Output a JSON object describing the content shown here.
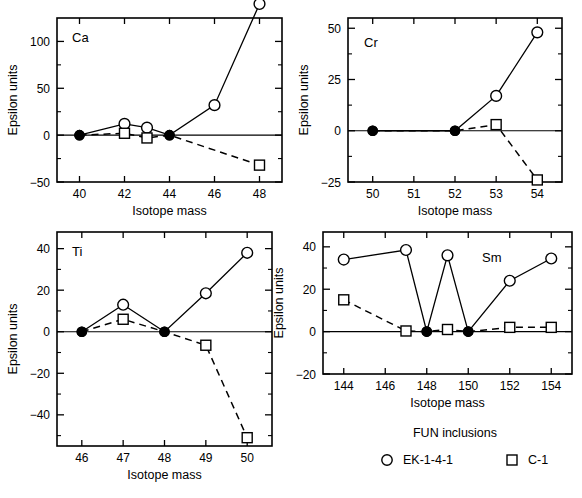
{
  "figure": {
    "axis_x_title": "Isotope mass",
    "axis_y_title": "Epsilon units"
  },
  "legend": {
    "title": "FUN inclusions",
    "entries": [
      {
        "marker": "open-circle-icon",
        "label": "EK-1-4-1"
      },
      {
        "marker": "open-square-icon",
        "label": "C-1"
      }
    ]
  },
  "chart_data": [
    {
      "type": "line",
      "title": "Ca",
      "xlabel": "Isotope mass",
      "ylabel": "Epsilon units",
      "xlim": [
        39,
        49
      ],
      "ylim": [
        -50,
        125
      ],
      "xticks": [
        40,
        42,
        44,
        46,
        48
      ],
      "yticks": [
        -50,
        0,
        50,
        100
      ],
      "grid": false,
      "legend_position": "external-bottom",
      "series": [
        {
          "name": "EK-1-4-1",
          "style": "solid",
          "x": [
            40,
            42,
            43,
            44,
            46,
            48
          ],
          "values": [
            0,
            12,
            8,
            0,
            32,
            140
          ],
          "markers": [
            "filled-circle",
            "open-circle",
            "open-circle",
            "filled-circle",
            "open-circle",
            "open-circle"
          ]
        },
        {
          "name": "C-1",
          "style": "dashed",
          "x": [
            40,
            42,
            43,
            44,
            48
          ],
          "values": [
            0,
            2,
            -3,
            0,
            -32
          ],
          "markers": [
            "filled-circle",
            "open-square",
            "open-square",
            "filled-circle",
            "open-square"
          ]
        }
      ]
    },
    {
      "type": "line",
      "title": "Cr",
      "xlabel": "Isotope mass",
      "ylabel": "Epsilon units",
      "xlim": [
        49.4,
        54.6
      ],
      "ylim": [
        -25,
        55
      ],
      "xticks": [
        50,
        51,
        52,
        53,
        54
      ],
      "yticks": [
        -25,
        0,
        25,
        50
      ],
      "grid": false,
      "legend_position": "external-bottom",
      "series": [
        {
          "name": "EK-1-4-1",
          "style": "solid",
          "x": [
            50,
            52,
            53,
            54
          ],
          "values": [
            0,
            0,
            17,
            48
          ],
          "markers": [
            "filled-circle",
            "filled-circle",
            "open-circle",
            "open-circle"
          ]
        },
        {
          "name": "C-1",
          "style": "dashed",
          "x": [
            50,
            52,
            53,
            54
          ],
          "values": [
            0,
            0,
            3,
            -24
          ],
          "markers": [
            "filled-circle",
            "filled-circle",
            "open-square",
            "open-square"
          ]
        }
      ]
    },
    {
      "type": "line",
      "title": "Ti",
      "xlabel": "Isotope mass",
      "ylabel": "Epsilon units",
      "xlim": [
        45.4,
        50.6
      ],
      "ylim": [
        -55,
        48
      ],
      "xticks": [
        46,
        47,
        48,
        49,
        50
      ],
      "yticks": [
        -40,
        -20,
        0,
        20,
        40
      ],
      "grid": false,
      "legend_position": "external-bottom",
      "series": [
        {
          "name": "EK-1-4-1",
          "style": "solid",
          "x": [
            46,
            47,
            48,
            49,
            50
          ],
          "values": [
            0,
            13,
            0,
            18.5,
            38
          ],
          "markers": [
            "filled-circle",
            "open-circle",
            "filled-circle",
            "open-circle",
            "open-circle"
          ]
        },
        {
          "name": "C-1",
          "style": "dashed",
          "x": [
            46,
            47,
            48,
            49,
            50
          ],
          "values": [
            0,
            6,
            0,
            -6.5,
            -51
          ],
          "markers": [
            "filled-circle",
            "open-square",
            "filled-circle",
            "open-square",
            "open-square"
          ]
        }
      ]
    },
    {
      "type": "line",
      "title": "Sm",
      "xlabel": "Isotope mass",
      "ylabel": "Epsilon units",
      "xlim": [
        143,
        155
      ],
      "ylim": [
        -20,
        47
      ],
      "xticks": [
        144,
        146,
        148,
        150,
        152,
        154
      ],
      "yticks": [
        -20,
        0,
        20,
        40
      ],
      "grid": false,
      "legend_position": "external-bottom",
      "series": [
        {
          "name": "EK-1-4-1",
          "style": "solid",
          "x": [
            144,
            147,
            148,
            149,
            150,
            152,
            154
          ],
          "values": [
            34,
            38.5,
            0,
            36,
            0,
            24,
            34.5
          ],
          "markers": [
            "open-circle",
            "open-circle",
            "filled-circle",
            "open-circle",
            "filled-circle",
            "open-circle",
            "open-circle"
          ]
        },
        {
          "name": "C-1",
          "style": "dashed",
          "x": [
            144,
            147,
            148,
            149,
            150,
            152,
            154
          ],
          "values": [
            15,
            0.3,
            0,
            1,
            0,
            2,
            2
          ],
          "markers": [
            "open-square",
            "open-square",
            "filled-circle",
            "open-square",
            "filled-circle",
            "open-square",
            "open-square"
          ]
        }
      ]
    }
  ]
}
